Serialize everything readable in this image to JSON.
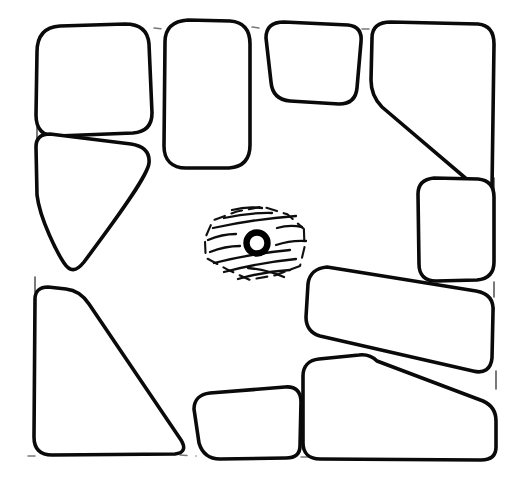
{
  "figure": {
    "canvas": {
      "width": 515,
      "height": 493
    },
    "colors": {
      "background": "#ffffff",
      "stone_outline": "#0a0a0a",
      "joint_dash": "#4a4a4a",
      "feature_outline": "#111111",
      "hatching": "#0d0d0d",
      "ring": "#000000"
    },
    "style": {
      "stone_stroke_width": 3.6,
      "joint_dash_pattern": "7 9",
      "feature_dash_pattern": "11 7"
    }
  },
  "central_feature": {
    "name": "hatched-pit-with-post-setting",
    "outline_kind": "dashed-ellipse",
    "hatching_direction": "diagonal",
    "hatch_line_count": 9,
    "center": {
      "x": 256,
      "y": 243
    },
    "radius_x": 52,
    "radius_y": 36,
    "post_ring": {
      "name": "post-setting-ring",
      "center": {
        "x": 257,
        "y": 243
      },
      "outer_radius": 13,
      "inner_radius": 8
    }
  },
  "stones": [
    {
      "id": "stone-nw-block",
      "label": "NW block",
      "position": "top-left",
      "form": "rounded-rectangle",
      "path": "M 37 52 C 37 36 44 27 60 26 L 125 24 C 140 24 148 31 149 44 L 152 113 C 152 125 146 132 133 133 L 57 136 C 43 137 36 129 36 115 Z"
    },
    {
      "id": "stone-n-tall",
      "label": "N tall block",
      "position": "top-center-left",
      "form": "tall-rounded-rectangle",
      "path": "M 165 42 C 165 28 173 21 188 20 L 230 21 C 244 22 250 30 250 44 L 250 145 C 250 159 243 167 229 168 L 186 168 C 172 168 164 160 164 146 Z"
    },
    {
      "id": "stone-n-small",
      "label": "N small block",
      "position": "top-center-right",
      "form": "trapezoid",
      "path": "M 266 38 C 266 27 272 22 284 22 L 348 25 C 358 26 362 32 361 42 L 357 88 C 356 99 350 104 339 104 L 290 101 C 278 100 272 93 271 82 Z"
    },
    {
      "id": "stone-ne-wedge",
      "label": "NE wedge",
      "position": "top-right",
      "form": "wedge",
      "path": "M 372 38 C 372 27 379 22 391 22 L 478 24 C 489 25 494 32 494 44 L 492 188 C 492 196 489 198 483 193 L 382 107 C 375 100 371 91 371 80 Z"
    },
    {
      "id": "stone-w-wedge",
      "label": "W wedge",
      "position": "left-upper",
      "form": "downward-triangle",
      "path": "M 36 147 C 36 138 41 134 50 134 L 131 144 C 144 146 150 152 149 163 C 148 174 126 206 84 262 C 76 272 70 272 64 263 C 58 254 40 220 37 195 Z"
    },
    {
      "id": "stone-sw-wedge",
      "label": "SW wedge",
      "position": "bottom-left",
      "form": "large-triangular-wedge",
      "path": "M 35 299 C 35 291 40 287 48 287 L 66 289 C 76 290 83 295 89 304 L 181 440 C 186 448 184 453 175 454 L 52 455 C 40 455 34 449 34 437 Z"
    },
    {
      "id": "stone-s-block",
      "label": "S block",
      "position": "bottom-center",
      "form": "irregular-pentagon",
      "path": "M 194 409 C 194 400 200 394 210 393 L 285 387 C 296 386 301 392 301 402 L 300 446 C 300 454 295 458 286 458 L 220 459 C 209 459 202 453 199 443 Z"
    },
    {
      "id": "stone-e-block",
      "label": "E block",
      "position": "right-middle",
      "form": "rounded-square",
      "path": "M 418 194 C 418 184 424 179 434 178 L 478 179 C 489 180 494 186 494 197 L 494 262 C 494 273 488 279 477 280 L 436 281 C 425 281 419 275 419 264 Z"
    },
    {
      "id": "stone-e-bar",
      "label": "E diagonal bar",
      "position": "right-lower-upper",
      "form": "elongated-diagonal-bar",
      "path": "M 308 284 C 309 274 316 268 327 267 L 476 291 C 488 293 494 300 493 312 L 492 358 C 491 369 484 374 473 371 L 320 336 C 310 333 306 327 306 317 Z"
    },
    {
      "id": "stone-se-block",
      "label": "SE block",
      "position": "bottom-right",
      "form": "wedge-rectangle",
      "path": "M 303 376 C 303 366 309 360 319 359 L 359 355 C 367 354 372 356 377 361 L 483 401 C 492 405 496 411 496 421 L 496 447 C 496 456 491 460 481 460 L 320 459 C 309 459 303 453 303 443 Z"
    }
  ],
  "joints": [
    {
      "id": "joint-top-1",
      "kind": "dash",
      "from": {
        "x": 154,
        "y": 28
      },
      "to": {
        "x": 163,
        "y": 29
      }
    },
    {
      "id": "joint-top-2",
      "kind": "dash",
      "from": {
        "x": 252,
        "y": 27
      },
      "to": {
        "x": 265,
        "y": 29
      }
    },
    {
      "id": "joint-top-3",
      "kind": "dash",
      "from": {
        "x": 362,
        "y": 29
      },
      "to": {
        "x": 371,
        "y": 29
      }
    },
    {
      "id": "joint-left-1",
      "kind": "tick",
      "from": {
        "x": 37,
        "y": 127
      },
      "to": {
        "x": 37,
        "y": 140
      }
    },
    {
      "id": "joint-left-2",
      "kind": "tick",
      "from": {
        "x": 35,
        "y": 277
      },
      "to": {
        "x": 35,
        "y": 292
      }
    },
    {
      "id": "joint-right-1",
      "kind": "tick",
      "from": {
        "x": 494,
        "y": 178
      },
      "to": {
        "x": 494,
        "y": 192
      }
    },
    {
      "id": "joint-right-2",
      "kind": "tick",
      "from": {
        "x": 494,
        "y": 282
      },
      "to": {
        "x": 494,
        "y": 297
      }
    },
    {
      "id": "joint-right-3",
      "kind": "tick",
      "from": {
        "x": 496,
        "y": 371
      },
      "to": {
        "x": 496,
        "y": 389
      }
    },
    {
      "id": "joint-bottom-1",
      "kind": "dash",
      "from": {
        "x": 180,
        "y": 455
      },
      "to": {
        "x": 196,
        "y": 456
      }
    },
    {
      "id": "joint-bottom-2",
      "kind": "dash",
      "from": {
        "x": 301,
        "y": 457
      },
      "to": {
        "x": 314,
        "y": 457
      }
    },
    {
      "id": "joint-bottom-3",
      "kind": "dash",
      "from": {
        "x": 28,
        "y": 456
      },
      "to": {
        "x": 40,
        "y": 456
      }
    }
  ],
  "hatch_lines": [
    {
      "x1": 224,
      "y1": 218,
      "x2": 272,
      "y2": 213
    },
    {
      "x1": 213,
      "y1": 228,
      "x2": 296,
      "y2": 216
    },
    {
      "x1": 208,
      "y1": 240,
      "x2": 236,
      "y2": 234
    },
    {
      "x1": 277,
      "y1": 228,
      "x2": 302,
      "y2": 227
    },
    {
      "x1": 210,
      "y1": 252,
      "x2": 240,
      "y2": 246
    },
    {
      "x1": 276,
      "y1": 245,
      "x2": 306,
      "y2": 241
    },
    {
      "x1": 214,
      "y1": 263,
      "x2": 290,
      "y2": 250
    },
    {
      "x1": 224,
      "y1": 272,
      "x2": 296,
      "y2": 259
    },
    {
      "x1": 238,
      "y1": 279,
      "x2": 290,
      "y2": 270
    },
    {
      "x1": 248,
      "y1": 268,
      "x2": 284,
      "y2": 277
    },
    {
      "x1": 232,
      "y1": 210,
      "x2": 262,
      "y2": 208
    }
  ]
}
